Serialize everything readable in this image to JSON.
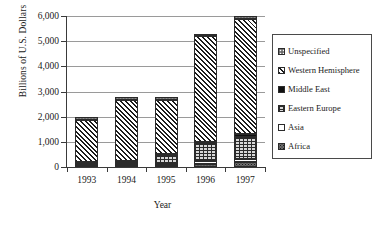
{
  "chart_data": {
    "type": "bar",
    "subtype": "stacked-bar",
    "title": "",
    "xlabel": "Year",
    "ylabel": "Billions of U.S. Dollars",
    "categories": [
      "1993",
      "1994",
      "1995",
      "1996",
      "1997"
    ],
    "ylim": [
      0,
      6000
    ],
    "yticks": [
      0,
      1000,
      2000,
      3000,
      4000,
      5000,
      6000
    ],
    "ytick_labels": [
      "0",
      "1,000",
      "2,000",
      "3,000",
      "4,000",
      "5,000",
      "6,000"
    ],
    "grid": true,
    "legend_position": "right",
    "series": [
      {
        "name": "Africa",
        "values": [
          60,
          70,
          80,
          120,
          180
        ]
      },
      {
        "name": "Asia",
        "values": [
          40,
          50,
          60,
          110,
          120
        ]
      },
      {
        "name": "Eastern Europe",
        "values": [
          60,
          80,
          350,
          730,
          900
        ]
      },
      {
        "name": "Middle East",
        "values": [
          30,
          30,
          30,
          50,
          130
        ]
      },
      {
        "name": "Western Hemisphere",
        "values": [
          1670,
          2450,
          2160,
          4190,
          4570
        ]
      },
      {
        "name": "Unspecified",
        "values": [
          140,
          100,
          100,
          50,
          100
        ]
      }
    ],
    "totals": [
      2000,
      2780,
      2780,
      5250,
      6000
    ]
  },
  "legend": {
    "items": [
      {
        "label": "Unspecified",
        "pattern": "checkered"
      },
      {
        "label": "Western Hemisphere",
        "pattern": "diagonal-hatch"
      },
      {
        "label": "Middle East",
        "pattern": "solid-black"
      },
      {
        "label": "Eastern Europe",
        "pattern": "brick-grid"
      },
      {
        "label": "Asia",
        "pattern": "empty-white"
      },
      {
        "label": "Africa",
        "pattern": "dotted-dark"
      }
    ]
  },
  "colors": {
    "axis": "#3a3a3a",
    "gridline": "#9a9a9a",
    "text": "#1a1a1a",
    "background": "#ffffff"
  }
}
